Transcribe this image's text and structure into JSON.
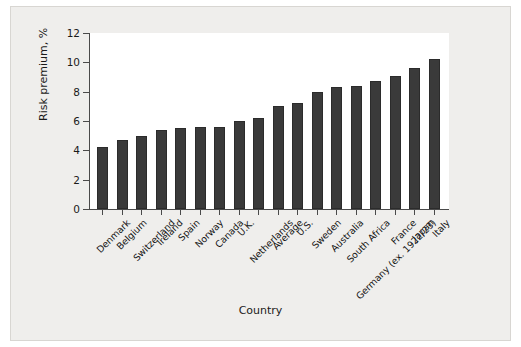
{
  "chart_data": {
    "type": "bar",
    "title": "",
    "xlabel": "Country",
    "ylabel": "Risk premium, %",
    "ylim": [
      0,
      12
    ],
    "yticks": [
      0,
      2,
      4,
      6,
      8,
      10,
      12
    ],
    "grid": false,
    "legend": null,
    "bar_color": "#3a3a3a",
    "categories": [
      "Denmark",
      "Belgium",
      "Switzerland",
      "Ireland",
      "Spain",
      "Norway",
      "Canada",
      "U.K.",
      "Netherlands",
      "Average",
      "U.S.",
      "Sweden",
      "Australia",
      "South Africa",
      "Germany (ex. 1922/23)",
      "France",
      "Japan",
      "Italy"
    ],
    "values": [
      4.2,
      4.7,
      5.0,
      5.4,
      5.5,
      5.6,
      5.6,
      6.0,
      6.2,
      7.0,
      7.2,
      8.0,
      8.3,
      8.4,
      8.7,
      9.1,
      9.6,
      10.2
    ]
  },
  "figure": {
    "background": "#efeeec",
    "plot_background": "#ffffff",
    "axis_color": "#4a4a4a"
  }
}
